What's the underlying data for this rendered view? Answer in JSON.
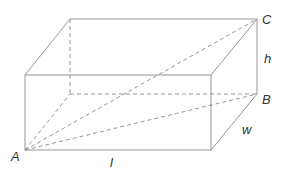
{
  "diagram": {
    "labels": {
      "A": "A",
      "B": "B",
      "C": "C",
      "length": "l",
      "width": "w",
      "height": "h"
    },
    "vertices": {
      "front_top_left": [
        25,
        75
      ],
      "front_top_right": [
        211,
        75
      ],
      "front_bottom_right": [
        211,
        150
      ],
      "A": [
        25,
        150
      ],
      "back_top_left": [
        70,
        19
      ],
      "C": [
        257,
        19
      ],
      "B": [
        257,
        94
      ],
      "back_bottom_left": [
        70,
        94
      ]
    },
    "colors": {
      "edge": "#8a8a8a",
      "label": "#333333",
      "background": "#ffffff"
    }
  }
}
